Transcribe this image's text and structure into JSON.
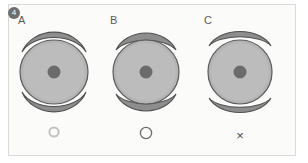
{
  "figure": {
    "badge_number": "4",
    "panel_background": "#fbfbfa",
    "panel_border_color": "#d9d9d6",
    "badge_color": "#6e6e6e"
  },
  "palette": {
    "lens_fill": "#b4b4b4",
    "lens_outline": "#5a5a5a",
    "lens_inner_ring": "#c9c9c9",
    "pupil_fill": "#6b6b6b",
    "arc_fill": "#8d8d8d",
    "arc_outline": "#4f4f4f",
    "label_text": "#5b5b5b",
    "symbol_light": "#c2c2c2",
    "symbol_dark": "#6d6d6d",
    "symbol_x": "#4d4d4d"
  },
  "columns": [
    {
      "label": "A",
      "arc_gap": "none",
      "arc_style": "overlapping",
      "symbol": "circle-small-light",
      "symbol_name": "result-ring-faint"
    },
    {
      "label": "B",
      "arc_gap": "thin",
      "arc_style": "lens-shaped",
      "symbol": "circle-open",
      "symbol_name": "result-ring-open"
    },
    {
      "label": "C",
      "arc_gap": "wide",
      "arc_style": "detached-crescent",
      "symbol": "cross",
      "symbol_name": "result-cross",
      "symbol_text": "×"
    }
  ]
}
